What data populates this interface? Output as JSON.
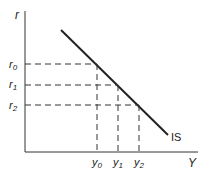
{
  "diagram": {
    "axes": {
      "y_label": "r",
      "x_label": "Y"
    },
    "curve_label": "IS",
    "interest_levels": [
      {
        "label": "r",
        "sub": "0"
      },
      {
        "label": "r",
        "sub": "1"
      },
      {
        "label": "r",
        "sub": "2"
      }
    ],
    "output_levels": [
      {
        "label": "y",
        "sub": "0"
      },
      {
        "label": "y",
        "sub": "1"
      },
      {
        "label": "y",
        "sub": "2"
      }
    ],
    "colors": {
      "line": "#222222",
      "axis": "#333333",
      "dashed": "#333333"
    }
  }
}
